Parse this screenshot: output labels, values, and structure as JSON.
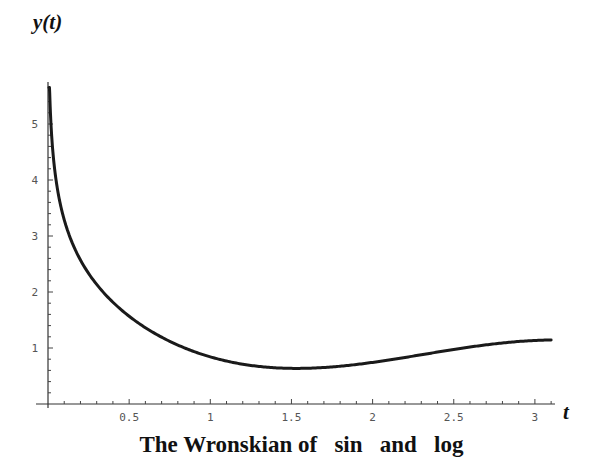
{
  "chart_data": {
    "type": "line",
    "title": "The Wronskian of   sin   and   log",
    "xlabel": "t",
    "ylabel": "y(t)",
    "function": "W(sin, log)(t) = sin(t)/t - cos(t)*log(t)",
    "xlim": [
      0,
      3.1
    ],
    "ylim": [
      0,
      5.7
    ],
    "x_ticks": [
      0.5,
      1,
      1.5,
      2,
      2.5,
      3
    ],
    "x_tick_labels": [
      "0.5",
      "1",
      "1.5",
      "2",
      "2.5",
      "3"
    ],
    "y_ticks": [
      1,
      2,
      3,
      4,
      5
    ],
    "y_tick_labels": [
      "1",
      "2",
      "3",
      "4",
      "5"
    ],
    "x_minor_step": 0.1,
    "y_minor_step": 0.2,
    "grid": false,
    "legend": null,
    "series": [
      {
        "name": "Wronskian",
        "color": "#1a1a1a",
        "x": [
          0.006,
          0.01,
          0.02,
          0.05,
          0.1,
          0.2,
          0.3,
          0.5,
          0.75,
          1.0,
          1.25,
          1.5,
          1.75,
          2.0,
          2.25,
          2.5,
          2.75,
          3.0,
          3.1
        ],
        "y": [
          5.65,
          5.61,
          4.91,
          3.99,
          3.29,
          2.57,
          2.13,
          1.57,
          1.12,
          0.84,
          0.68,
          0.64,
          0.67,
          0.74,
          0.82,
          0.91,
          0.99,
          1.09,
          1.14
        ]
      }
    ]
  },
  "labels": {
    "y_axis": "y(t)",
    "x_axis": "t",
    "caption": "The Wronskian of   sin   and   log"
  }
}
